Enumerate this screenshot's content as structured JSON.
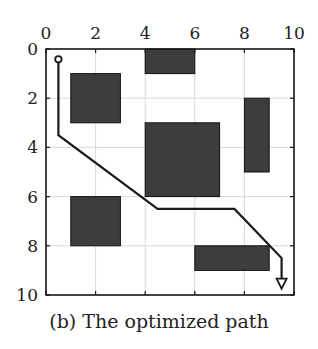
{
  "caption": "(b) The optimized path",
  "colors": {
    "obstacle": "#3d3d3d",
    "path": "#1a1a1a",
    "grid": "#d9d9d9",
    "frame": "#1a1a1a"
  },
  "axes": {
    "x_ticks": [
      "0",
      "2",
      "4",
      "6",
      "8",
      "10"
    ],
    "y_ticks": [
      "0",
      "2",
      "4",
      "6",
      "8",
      "10"
    ],
    "x_range": [
      0,
      10
    ],
    "y_range": [
      0,
      10
    ],
    "grid": true
  },
  "chart_data": {
    "type": "diagram",
    "title": "(b) The optimized path",
    "xlim": [
      0,
      10
    ],
    "ylim": [
      0,
      10
    ],
    "y_inverted": true,
    "obstacles": [
      {
        "x": 4,
        "y": 0,
        "w": 2,
        "h": 1
      },
      {
        "x": 1,
        "y": 1,
        "w": 2,
        "h": 2
      },
      {
        "x": 8,
        "y": 2,
        "w": 1,
        "h": 3
      },
      {
        "x": 4,
        "y": 3,
        "w": 3,
        "h": 3
      },
      {
        "x": 1,
        "y": 6,
        "w": 2,
        "h": 2
      },
      {
        "x": 6,
        "y": 8,
        "w": 3,
        "h": 1
      }
    ],
    "path": [
      [
        0.5,
        0.5
      ],
      [
        0.5,
        3.5
      ],
      [
        4.5,
        6.5
      ],
      [
        7.6,
        6.5
      ],
      [
        9.5,
        8.5
      ],
      [
        9.5,
        9.7
      ]
    ],
    "start_marker": "circle",
    "end_marker": "arrow"
  }
}
